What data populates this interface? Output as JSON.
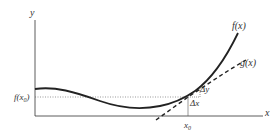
{
  "diagram": {
    "axes": {
      "x_label": "x",
      "y_label": "y"
    },
    "curves": [
      {
        "name": "f",
        "label": "f(x)",
        "style": "solid"
      },
      {
        "name": "g",
        "label": "g(x)",
        "style": "dashed"
      }
    ],
    "point": {
      "x_label": "x",
      "x_sub": "0",
      "y_label_prefix": "f(x",
      "y_sub": "0",
      "y_label_suffix": ")"
    },
    "increments": {
      "dx": "Δx",
      "dy": "Δy"
    },
    "colors": {
      "stroke": "#222222",
      "text": "#333333"
    }
  }
}
